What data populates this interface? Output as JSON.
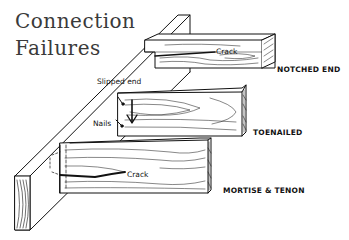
{
  "title": {
    "line1": "Connection",
    "line2": "Failures"
  },
  "labels": {
    "notched_crack": "Crack",
    "notched_end": "NOTCHED END",
    "slipped_end": "Slipped end",
    "nails": "Nails",
    "toenailed": "TOENAILED",
    "mortise_crack": "Crack",
    "mortise_tenon": "MORTISE & TENON"
  },
  "colors": {
    "ink": "#111111",
    "title": "#3a3a3a",
    "background": "#ffffff"
  }
}
